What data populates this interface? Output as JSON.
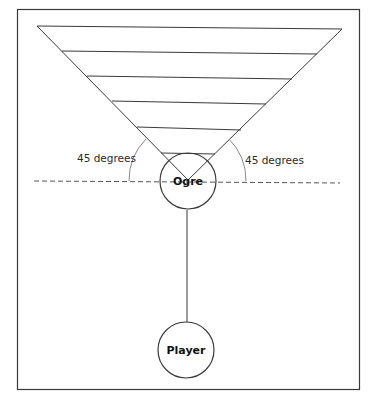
{
  "diagram": {
    "type": "field-of-view illustration",
    "frame_color": "#3a3a3a",
    "line_color": "#3a3a3a",
    "arc_color": "#7a7a7a",
    "nodes": {
      "ogre": {
        "label": "Ogre"
      },
      "player": {
        "label": "Player"
      }
    },
    "angles": {
      "left_label": "45 degrees",
      "right_label": "45 degrees"
    },
    "view_cone": {
      "band_count": 6
    }
  }
}
